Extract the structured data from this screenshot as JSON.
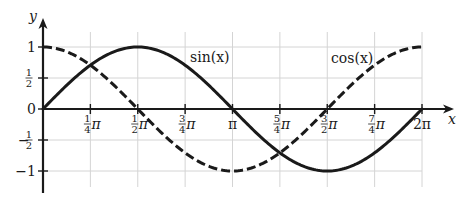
{
  "chart_data": {
    "type": "line",
    "title": "",
    "xlabel": "x",
    "ylabel": "y",
    "xlim": [
      0,
      6.2832
    ],
    "ylim": [
      -1,
      1
    ],
    "grid": true,
    "legend": "inline labels",
    "x_ticks": [
      {
        "value": 0.7854,
        "num": "1",
        "den": "4",
        "suffix": "π"
      },
      {
        "value": 1.5708,
        "num": "1",
        "den": "2",
        "suffix": "π"
      },
      {
        "value": 2.3562,
        "num": "3",
        "den": "4",
        "suffix": "π"
      },
      {
        "value": 3.1416,
        "num": "",
        "den": "",
        "suffix": "π"
      },
      {
        "value": 3.927,
        "num": "5",
        "den": "4",
        "suffix": "π"
      },
      {
        "value": 4.7124,
        "num": "3",
        "den": "2",
        "suffix": "π"
      },
      {
        "value": 5.4978,
        "num": "7",
        "den": "4",
        "suffix": "π"
      },
      {
        "value": 6.2832,
        "num": "",
        "den": "",
        "suffix": "2π"
      }
    ],
    "y_ticks": [
      {
        "value": 1,
        "label": "1",
        "num": "",
        "den": ""
      },
      {
        "value": 0.5,
        "label": "",
        "num": "1",
        "den": "2"
      },
      {
        "value": 0,
        "label": "0",
        "num": "",
        "den": ""
      },
      {
        "value": -0.5,
        "label": "−",
        "num": "1",
        "den": "2"
      },
      {
        "value": -1,
        "label": "−1",
        "num": "",
        "den": ""
      }
    ],
    "series": [
      {
        "name": "sin(x)",
        "function": "sin",
        "style": "solid",
        "label_text": "sin(x)",
        "label_pos": [
          2.45,
          0.82
        ],
        "x": [
          0,
          0.7854,
          1.5708,
          2.3562,
          3.1416,
          3.927,
          4.7124,
          5.4978,
          6.2832
        ],
        "values": [
          0,
          0.707,
          1,
          0.707,
          0,
          -0.707,
          -1,
          -0.707,
          0
        ]
      },
      {
        "name": "cos(x)",
        "function": "cos",
        "style": "dashed",
        "label_text": "cos(x)",
        "label_pos": [
          4.95,
          0.82
        ],
        "x": [
          0,
          0.7854,
          1.5708,
          2.3562,
          3.1416,
          3.927,
          4.7124,
          5.4978,
          6.2832
        ],
        "values": [
          1,
          0.707,
          0,
          -0.707,
          -1,
          -0.707,
          0,
          0.707,
          1
        ]
      }
    ],
    "colors": {
      "line": "#1a1a1a",
      "grid": "#d4d4d4",
      "background": "#ffffff"
    }
  }
}
